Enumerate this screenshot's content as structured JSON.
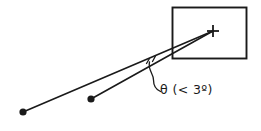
{
  "figure": {
    "background_color": "#ffffff",
    "ink_color": "#1a1a1a",
    "width": 261,
    "height": 131,
    "annotation": {
      "angle_label": "θ  (< 3º)",
      "angle_symbol": "θ",
      "angle_condition": "(< 3º)",
      "angle_max_degrees": 3
    },
    "elements": {
      "target_box_label": "target-box",
      "crosshair_label": "target-crosshair",
      "observer_dot_near_label": "observer-point-near",
      "observer_dot_far_label": "observer-point-far",
      "ray_near_label": "sight-line-near",
      "ray_far_label": "sight-line-far",
      "leader_label": "angle-leader-line"
    },
    "geometry": {
      "box": {
        "x": 172.5,
        "y": 7.5,
        "width": 74,
        "height": 51
      },
      "crosshair": {
        "cx": 213,
        "cy": 31,
        "arm": 6
      },
      "dot_far": {
        "cx": 23,
        "cy": 112,
        "r": 3.6
      },
      "dot_near": {
        "cx": 91,
        "cy": 99,
        "r": 3.6
      },
      "ray_far": {
        "x1": 23,
        "y1": 112,
        "x2": 213,
        "y2": 31
      },
      "ray_near": {
        "x1": 91,
        "y1": 99,
        "x2": 213,
        "y2": 31
      }
    }
  }
}
